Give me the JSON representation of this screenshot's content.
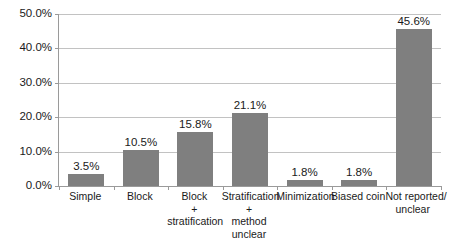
{
  "chart_data": {
    "type": "bar",
    "title": "",
    "subtitle": "",
    "xlabel": "",
    "ylabel": "",
    "ylim": [
      0,
      50
    ],
    "grid": true,
    "legend": false,
    "legend_position": "none",
    "bar_color": "#7f7f7f",
    "gridline_color": "#c2c2c2",
    "axis_color": "#9a9a9a",
    "background_color": "#ffffff",
    "categories": [
      "Simple",
      "Block",
      "Block + stratification",
      "Stratification + method unclear",
      "Minimization",
      "Biased coin",
      "Not reported/ unclear"
    ],
    "category_lines": [
      [
        "Simple"
      ],
      [
        "Block"
      ],
      [
        "Block",
        "+",
        "stratification"
      ],
      [
        "Stratification",
        "+",
        "method",
        "unclear"
      ],
      [
        "Minimization"
      ],
      [
        "Biased coin"
      ],
      [
        "Not reported/",
        "unclear"
      ]
    ],
    "values": [
      3.5,
      10.5,
      15.8,
      21.1,
      1.8,
      1.8,
      45.6
    ],
    "data_labels": [
      "3.5%",
      "10.5%",
      "15.8%",
      "21.1%",
      "1.8%",
      "1.8%",
      "45.6%"
    ],
    "y_ticks": [
      0,
      10,
      20,
      30,
      40,
      50
    ],
    "y_tick_labels": [
      "0.0%",
      "10.0%",
      "20.0%",
      "30.0%",
      "40.0%",
      "50.0%"
    ]
  }
}
